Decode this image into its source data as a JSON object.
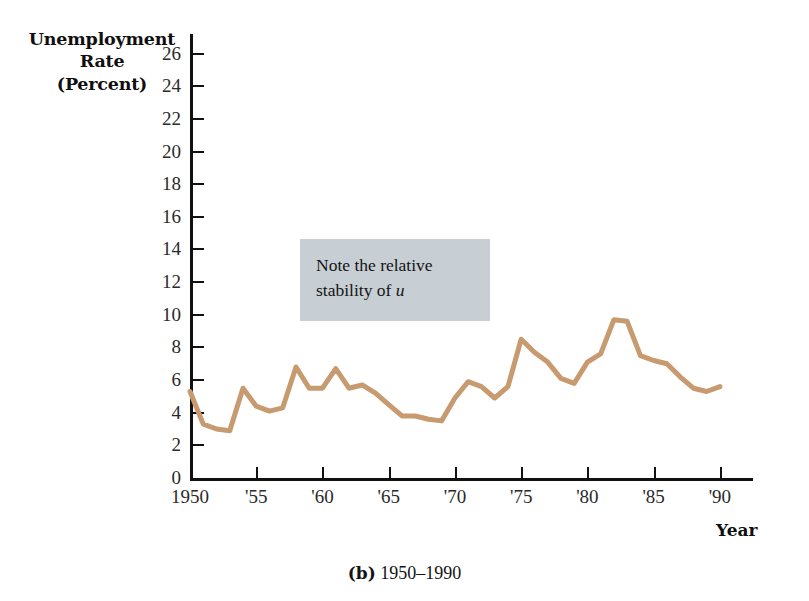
{
  "figure": {
    "caption_label": "(b)",
    "caption_range": "1950–1990"
  },
  "annotation": {
    "line1": "Note the relative",
    "line2_prefix": "stability of ",
    "line2_symbol": "u",
    "background_color": "#c7cfd4"
  },
  "axes": {
    "y_title_line1": "Unemployment",
    "y_title_line2": "Rate",
    "y_title_line3": "(Percent)",
    "x_title": "Year"
  },
  "chart_data": {
    "type": "line",
    "title": "",
    "subtitle": "",
    "xlabel": "Year",
    "ylabel": "Unemployment Rate (Percent)",
    "xlim": [
      1950,
      1992.5
    ],
    "ylim": [
      0,
      27.2
    ],
    "grid": false,
    "legend": "none",
    "line_color": "#c79a6f",
    "line_width": 5,
    "y_ticks": [
      0,
      2,
      4,
      6,
      8,
      10,
      12,
      14,
      16,
      18,
      20,
      22,
      24,
      26
    ],
    "y_tick_labels": [
      "0",
      "2",
      "4",
      "6",
      "8",
      "10",
      "12",
      "14",
      "16",
      "18",
      "20",
      "22",
      "24",
      "26"
    ],
    "x_ticks": [
      1950,
      1955,
      1960,
      1965,
      1970,
      1975,
      1980,
      1985,
      1990
    ],
    "x_tick_labels": [
      "1950",
      "'55",
      "'60",
      "'65",
      "'70",
      "'75",
      "'80",
      "'85",
      "'90"
    ],
    "series": [
      {
        "name": "Unemployment Rate",
        "x": [
          1950,
          1951,
          1952,
          1953,
          1954,
          1955,
          1956,
          1957,
          1958,
          1959,
          1960,
          1961,
          1962,
          1963,
          1964,
          1965,
          1966,
          1967,
          1968,
          1969,
          1970,
          1971,
          1972,
          1973,
          1974,
          1975,
          1976,
          1977,
          1978,
          1979,
          1980,
          1981,
          1982,
          1983,
          1984,
          1985,
          1986,
          1987,
          1988,
          1989,
          1990
        ],
        "values": [
          5.3,
          3.3,
          3.0,
          2.9,
          5.5,
          4.4,
          4.1,
          4.3,
          6.8,
          5.5,
          5.5,
          6.7,
          5.5,
          5.7,
          5.2,
          4.5,
          3.8,
          3.8,
          3.6,
          3.5,
          4.9,
          5.9,
          5.6,
          4.9,
          5.6,
          8.5,
          7.7,
          7.1,
          6.1,
          5.8,
          7.1,
          7.6,
          9.7,
          9.6,
          7.5,
          7.2,
          7.0,
          6.2,
          5.5,
          5.3,
          5.6
        ]
      }
    ]
  }
}
